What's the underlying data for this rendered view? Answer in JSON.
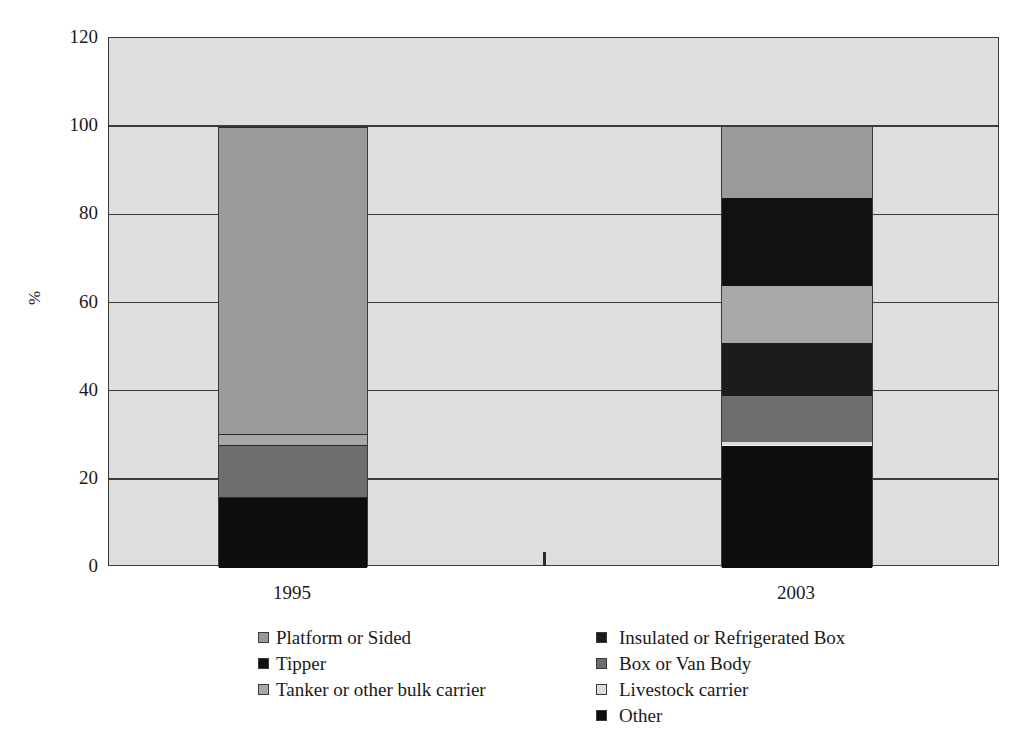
{
  "chart_data": {
    "type": "bar",
    "stacked": true,
    "title": "",
    "subtitle": "",
    "xlabel": "",
    "ylabel": "%",
    "ylim": [
      0,
      120
    ],
    "ytick_labels": [
      "120",
      "100",
      "80",
      "60",
      "40",
      "20",
      "0"
    ],
    "ytick_values": [
      120,
      100,
      80,
      60,
      40,
      20,
      0
    ],
    "grid": true,
    "legend_position": "bottom",
    "categories": [
      "1995",
      "2003"
    ],
    "series": [
      {
        "name": "Platform or Sided",
        "color": "#9a9a9a",
        "values": [
          69.5,
          15.5
        ]
      },
      {
        "name": "Tipper",
        "color": "#111111",
        "values": [
          0.0,
          19.5
        ]
      },
      {
        "name": "Tanker or other bulk carrier",
        "color": "#a8a8a8",
        "values": [
          2.5,
          13.0
        ]
      },
      {
        "name": "Insulated or Refrigerated Box",
        "color": "#1c1c1c",
        "values": [
          0.0,
          12.0
        ]
      },
      {
        "name": "Box or Van Body",
        "color": "#6e6e6e",
        "values": [
          12.0,
          11.5
        ]
      },
      {
        "name": "Livestock carrier",
        "color": "#dcdcdc",
        "values": [
          0.0,
          0.5
        ]
      },
      {
        "name": "Other",
        "color": "#0d0d0d",
        "values": [
          16.0,
          28.0
        ]
      }
    ],
    "bars": [
      {
        "category": "1995",
        "total": 100,
        "segments": [
          {
            "label": "Other",
            "from": 0.0,
            "to": 16.0,
            "color": "#0d0d0d",
            "separator": "dark"
          },
          {
            "label": "Box or Van Body",
            "from": 16.0,
            "to": 28.0,
            "color": "#6e6e6e",
            "separator": "dark"
          },
          {
            "label": "Tanker or other bulk carrier",
            "from": 28.0,
            "to": 30.5,
            "color": "#a8a8a8",
            "separator": "dark"
          },
          {
            "label": "Platform or Sided",
            "from": 30.5,
            "to": 100.0,
            "color": "#9a9a9a",
            "separator": "dark"
          }
        ]
      },
      {
        "category": "2003",
        "total": 100,
        "segments": [
          {
            "label": "Other",
            "from": 0.0,
            "to": 28.0,
            "color": "#0d0d0d",
            "separator": "light"
          },
          {
            "label": "Livestock carrier",
            "from": 28.0,
            "to": 28.6,
            "color": "#dcdcdc",
            "separator": "none"
          },
          {
            "label": "Box or Van Body",
            "from": 28.6,
            "to": 39.0,
            "color": "#6e6e6e",
            "separator": "none"
          },
          {
            "label": "Insulated or Refrigerated Box",
            "from": 39.0,
            "to": 51.0,
            "color": "#1c1c1c",
            "separator": "none"
          },
          {
            "label": "Tanker or other bulk carrier",
            "from": 51.0,
            "to": 64.0,
            "color": "#a8a8a8",
            "separator": "none"
          },
          {
            "label": "Tipper",
            "from": 64.0,
            "to": 84.0,
            "color": "#111111",
            "separator": "none"
          },
          {
            "label": "Platform or Sided",
            "from": 84.0,
            "to": 100.0,
            "color": "#9a9a9a",
            "separator": "none"
          }
        ]
      }
    ]
  },
  "axes": {
    "y_title": "%",
    "y_ticks": [
      "120",
      "100",
      "80",
      "60",
      "40",
      "20",
      "0"
    ],
    "x_ticks": [
      "1995",
      "2003"
    ]
  },
  "legend": {
    "left_column": [
      {
        "label": "Platform or Sided",
        "color": "#9a9a9a"
      },
      {
        "label": "Tipper",
        "color": "#111111"
      },
      {
        "label": "Tanker or other bulk carrier",
        "color": "#a8a8a8"
      }
    ],
    "right_column": [
      {
        "label": "Insulated or Refrigerated Box",
        "color": "#1c1c1c"
      },
      {
        "label": "Box or Van Body",
        "color": "#6e6e6e"
      },
      {
        "label": "Livestock carrier",
        "color": "#dcdcdc"
      },
      {
        "label": "Other",
        "color": "#0d0d0d"
      }
    ]
  },
  "colors": {
    "plot_background": "#dedede",
    "axis": "#3a3a3a",
    "page_background": "#ffffff"
  }
}
